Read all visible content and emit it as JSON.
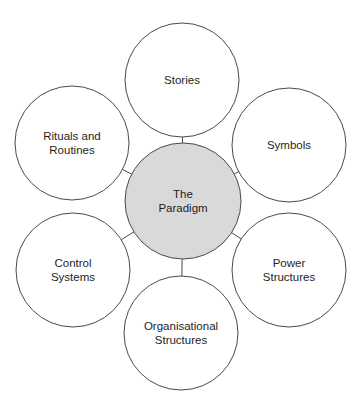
{
  "diagram": {
    "colors": {
      "stroke": "#4a4a4a",
      "center_fill": "#d9d9d9",
      "outer_fill": "#ffffff",
      "text": "#1e1e1e"
    },
    "center": {
      "id": "paradigm",
      "lines": [
        "The",
        "Paradigm"
      ],
      "cx": 183,
      "cy": 201,
      "r": 58
    },
    "nodes": [
      {
        "id": "stories",
        "lines": [
          "Stories"
        ],
        "cx": 182,
        "cy": 80,
        "r": 57
      },
      {
        "id": "symbols",
        "lines": [
          "Symbols"
        ],
        "cx": 289,
        "cy": 145,
        "r": 57
      },
      {
        "id": "power-structures",
        "lines": [
          "Power",
          "Structures"
        ],
        "cx": 289,
        "cy": 270,
        "r": 57
      },
      {
        "id": "organisational-structures",
        "lines": [
          "Organisational",
          "Structures"
        ],
        "cx": 181,
        "cy": 333,
        "r": 57
      },
      {
        "id": "control-systems",
        "lines": [
          "Control",
          "Systems"
        ],
        "cx": 73,
        "cy": 270,
        "r": 57
      },
      {
        "id": "rituals-and-routines",
        "lines": [
          "Rituals and",
          "Routines"
        ],
        "cx": 72,
        "cy": 143,
        "r": 57
      }
    ]
  }
}
